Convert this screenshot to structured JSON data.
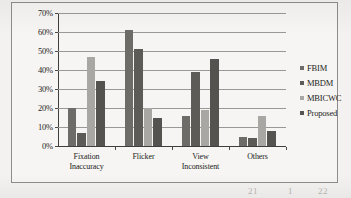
{
  "chart_data": {
    "type": "bar",
    "title": "",
    "subtitle": "",
    "xlabel": "",
    "ylabel": "",
    "ylim": [
      0,
      70
    ],
    "ytick_step": 10,
    "ytick_labels": [
      "0%",
      "10%",
      "20%",
      "30%",
      "40%",
      "50%",
      "60%",
      "70%"
    ],
    "grid": true,
    "legend_position": "right",
    "categories": [
      "Fixation Inaccuracy",
      "Flicker",
      "View Inconsistent",
      "Others"
    ],
    "category_lines": [
      [
        "Fixation",
        "Inaccuracy"
      ],
      [
        "Flicker",
        ""
      ],
      [
        "View",
        "Inconsistent"
      ],
      [
        "Others",
        ""
      ]
    ],
    "series": [
      {
        "name": "FBIM",
        "color": "#6e6c69",
        "values": [
          20,
          61,
          16,
          5
        ]
      },
      {
        "name": "MBDM",
        "color": "#5d5b58",
        "values": [
          7,
          51,
          39,
          4
        ]
      },
      {
        "name": "MBICWC",
        "color": "#a9a7a3",
        "values": [
          47,
          20,
          19,
          16
        ]
      },
      {
        "name": "Proposed",
        "color": "#555350",
        "values": [
          34,
          15,
          46,
          8
        ]
      }
    ]
  },
  "legend": {
    "items": [
      {
        "label": "FBIM",
        "marker": "square-marker"
      },
      {
        "label": "MBDM",
        "marker": "square-marker"
      },
      {
        "label": "MBICWC",
        "marker": "square-marker"
      },
      {
        "label": "Proposed",
        "marker": "square-marker"
      }
    ]
  },
  "scan_artifacts": {
    "left_text": "",
    "right_text_1": "21",
    "right_text_2": "1",
    "right_text_3": "22"
  }
}
